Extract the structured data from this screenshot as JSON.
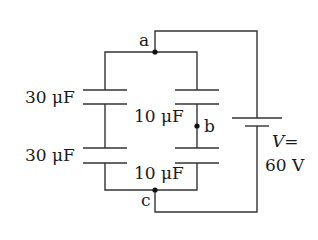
{
  "diagram": {
    "type": "circuit",
    "colors": {
      "wire": "#333333",
      "text": "#1a1a1a",
      "background": "#ffffff"
    },
    "nodes": [
      {
        "id": "a",
        "label": "a"
      },
      {
        "id": "b",
        "label": "b"
      },
      {
        "id": "c",
        "label": "c"
      }
    ],
    "capacitors": [
      {
        "id": "C1",
        "label": "30 μF",
        "branch": "left",
        "position": "top"
      },
      {
        "id": "C2",
        "label": "30 μF",
        "branch": "left",
        "position": "bottom"
      },
      {
        "id": "C3",
        "label": "10 μF",
        "branch": "right",
        "position": "top"
      },
      {
        "id": "C4",
        "label": "10 μF",
        "branch": "right",
        "position": "bottom"
      }
    ],
    "battery": {
      "symbol": "V=",
      "value": "60 V"
    }
  }
}
